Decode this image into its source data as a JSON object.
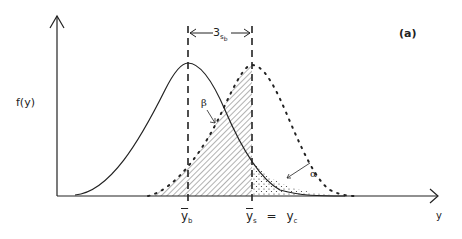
{
  "figure": {
    "panel_label": "(a)",
    "y_axis_label": "f(y)",
    "x_axis_label": "y",
    "width_annotation": {
      "text": "3",
      "subscript_base": "s",
      "subscript_sub": "b"
    },
    "x_ticks": [
      {
        "label": "y",
        "overline": true,
        "subscript": "b"
      },
      {
        "label": "y",
        "overline": true,
        "subscript": "s",
        "equals": "=",
        "rhs": "y",
        "rhs_subscript": "c"
      }
    ],
    "region_labels": {
      "beta": "β",
      "alpha": "α"
    },
    "curves": [
      {
        "name": "background-distribution",
        "style": "solid",
        "peak_label": "ȳ_b"
      },
      {
        "name": "signal-distribution",
        "style": "dotted",
        "peak_label": "ȳ_s"
      }
    ],
    "shaded_regions": [
      {
        "name": "beta-region",
        "fill": "hatched"
      },
      {
        "name": "alpha-region",
        "fill": "stippled"
      }
    ]
  }
}
